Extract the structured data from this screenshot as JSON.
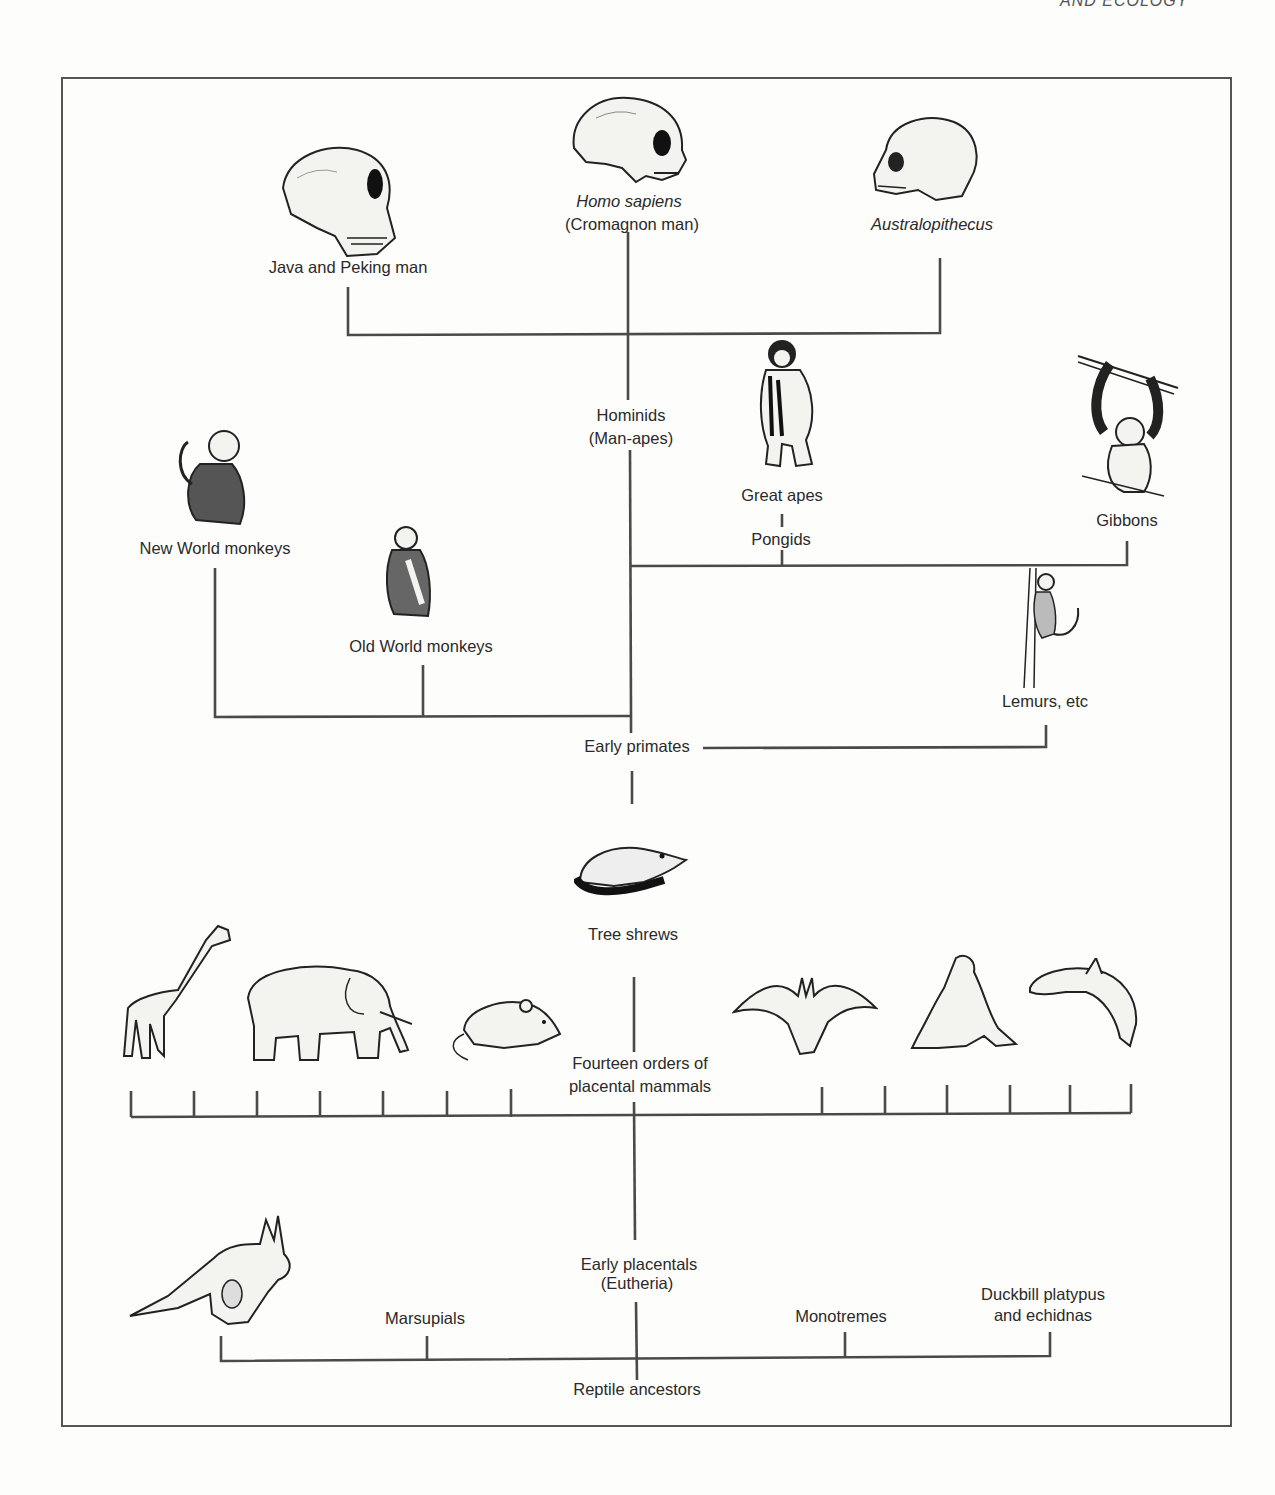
{
  "page": {
    "running_head": "AND ECOLOGY"
  },
  "diagram": {
    "hominid_tier": {
      "homo_sapiens": {
        "line1": "Homo sapiens",
        "line2": "(Cromagnon man)",
        "icon": "human-skull-icon"
      },
      "java_peking": {
        "label": "Java and Peking man",
        "icon": "erectus-skull-icon"
      },
      "australopithecus": {
        "label": "Australopithecus",
        "icon": "australopithecus-skull-icon"
      },
      "hominids": {
        "line1": "Hominids",
        "line2": "(Man-apes)"
      }
    },
    "primate_tier": {
      "great_apes": {
        "label": "Great apes",
        "icon": "chimpanzee-icon"
      },
      "pongids": {
        "label": "Pongids"
      },
      "gibbons": {
        "label": "Gibbons",
        "icon": "gibbon-icon"
      },
      "new_world": {
        "label": "New World monkeys",
        "icon": "new-world-monkey-icon"
      },
      "old_world": {
        "label": "Old World monkeys",
        "icon": "old-world-monkey-icon"
      },
      "lemurs": {
        "label": "Lemurs, etc",
        "icon": "lemur-icon"
      },
      "early_primates": {
        "label": "Early primates"
      }
    },
    "mammal_tier": {
      "tree_shrews": {
        "label": "Tree shrews",
        "icon": "tree-shrew-icon"
      },
      "placental_orders": {
        "line1": "Fourteen orders of",
        "line2": "placental mammals"
      },
      "animals": [
        "giraffe-icon",
        "elephant-icon",
        "mouse-icon",
        "bat-icon",
        "sea-lion-icon",
        "dolphin-icon"
      ],
      "order_count": 14
    },
    "base_tier": {
      "early_placentals": {
        "line1": "Early placentals",
        "line2": "(Eutheria)"
      },
      "marsupials": {
        "label": "Marsupials",
        "icon": "kangaroo-icon"
      },
      "monotremes": {
        "label": "Monotremes"
      },
      "platypus": {
        "line1": "Duckbill platypus",
        "line2": "and echidnas"
      },
      "reptile_ancestors": {
        "label": "Reptile ancestors"
      }
    },
    "colors": {
      "line": "#4a4a4a",
      "text": "#2a2a2a",
      "frame": "#555555"
    }
  }
}
